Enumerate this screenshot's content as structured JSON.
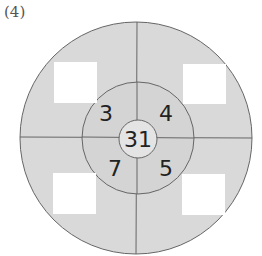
{
  "problem_label": "(4)",
  "diagram": {
    "center_value": "31",
    "inner_ring_values": {
      "top_left": "3",
      "top_right": "4",
      "bottom_left": "7",
      "bottom_right": "5"
    },
    "outer_ring_answer_boxes": [
      "",
      "",
      "",
      ""
    ],
    "colors": {
      "fill": "#d9d9d9",
      "stroke": "#666666",
      "box": "#ffffff"
    }
  }
}
